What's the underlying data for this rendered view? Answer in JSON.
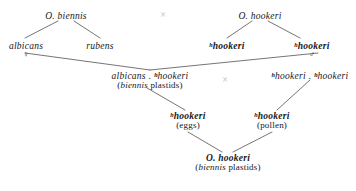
{
  "diagram": {
    "type": "pedigree-crossing-diagram",
    "line_color": "#3a3a3a",
    "cross_symbol_color": "#b9b9b9",
    "text_color": "#17171c",
    "background": "#ffffff",
    "symbols": {
      "female": "♀",
      "male": "♂",
      "cross": "×",
      "superscript_h": "h",
      "dot_separator": " . "
    },
    "nodes": {
      "biennis_parent": {
        "label": "O. biennis",
        "role": "parent-species-left"
      },
      "albicans": {
        "label": "albicans",
        "sex": "♀",
        "role": "complex-left"
      },
      "rubens": {
        "label": "rubens",
        "role": "complex-left"
      },
      "hookeri_parent": {
        "label": "O. hookeri",
        "role": "parent-species-right"
      },
      "hhookeri_left": {
        "sup": "h",
        "label": "hookeri",
        "role": "complex-right"
      },
      "hhookeri_right": {
        "sup": "h",
        "label": "hookeri",
        "sex": "♂",
        "role": "complex-right"
      },
      "albicans_hhookeri": {
        "line1_a": "albicans",
        "line1_sep": " . ",
        "line1_sup": "h",
        "line1_b": "hookeri",
        "line2_open": "(",
        "line2_italic": "biennis",
        "line2_rest": " plastids)",
        "role": "f1-hybrid-left"
      },
      "hhookeri_hhookeri": {
        "line1_sup_a": "h",
        "line1_a": "hookeri",
        "line1_sep": " . ",
        "line1_sup_b": "h",
        "line1_b": "hookeri",
        "role": "f1-hybrid-right"
      },
      "eggs_node": {
        "sup": "h",
        "label": "hookeri",
        "line2": "(eggs)",
        "role": "gamete-eggs"
      },
      "pollen_node": {
        "sup": "h",
        "label": "hookeri",
        "line2": "(pollen)",
        "role": "gamete-pollen"
      },
      "offspring": {
        "line1": "O. hookeri",
        "line2_open": "(",
        "line2_italic": "biennis",
        "line2_rest": " plastids)",
        "role": "final-offspring"
      }
    },
    "cross_marks": [
      {
        "name": "cross-top",
        "glyph": "×"
      },
      {
        "name": "cross-middle",
        "glyph": "×"
      }
    ]
  }
}
